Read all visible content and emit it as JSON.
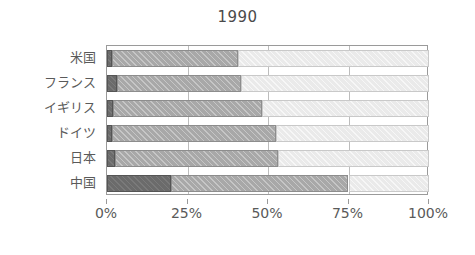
{
  "chart_data": {
    "type": "bar",
    "orientation": "horizontal",
    "stacked": true,
    "normalized": true,
    "title": "1990",
    "xlabel": "",
    "ylabel": "",
    "xlim": [
      0,
      100
    ],
    "grid": true,
    "legend": null,
    "categories": [
      "米国",
      "フランス",
      "イギリス",
      "ドイツ",
      "日本",
      "中国"
    ],
    "xticks": [
      0,
      25,
      50,
      75,
      100
    ],
    "xtick_labels": [
      "0%",
      "25%",
      "50%",
      "75%",
      "100%"
    ],
    "series": [
      {
        "name": "segment-1",
        "color": "#6b6b6b",
        "values": [
          1.5,
          3.0,
          2.0,
          1.5,
          2.5,
          20.0
        ]
      },
      {
        "name": "segment-2",
        "color": "#a8a8a8",
        "values": [
          39.2,
          38.6,
          46.0,
          51.0,
          50.5,
          55.0
        ]
      },
      {
        "name": "segment-3",
        "color": "#eaeaea",
        "values": [
          59.3,
          58.4,
          52.0,
          47.5,
          47.0,
          25.0
        ]
      }
    ],
    "rows": [
      {
        "category": "米国",
        "segments": [
          1.5,
          39.2,
          59.3
        ],
        "cumulative": [
          1.5,
          40.7,
          100.0
        ]
      },
      {
        "category": "フランス",
        "segments": [
          3.0,
          38.6,
          58.4
        ],
        "cumulative": [
          3.0,
          41.6,
          100.0
        ]
      },
      {
        "category": "イギリス",
        "segments": [
          2.0,
          46.0,
          52.0
        ],
        "cumulative": [
          2.0,
          48.0,
          100.0
        ]
      },
      {
        "category": "ドイツ",
        "segments": [
          1.5,
          51.0,
          47.5
        ],
        "cumulative": [
          1.5,
          52.5,
          100.0
        ]
      },
      {
        "category": "日本",
        "segments": [
          2.5,
          50.5,
          47.0
        ],
        "cumulative": [
          2.5,
          53.0,
          100.0
        ]
      },
      {
        "category": "中国",
        "segments": [
          20.0,
          55.0,
          25.0
        ],
        "cumulative": [
          20.0,
          75.0,
          100.0
        ]
      }
    ]
  },
  "colors": {
    "axis": "#9a9a9a",
    "grid": "#bdbdbd",
    "text": "#5a5a5a",
    "background": "#ffffff",
    "segment_dark": "#6b6b6b",
    "segment_mid": "#a8a8a8",
    "segment_light": "#eaeaea"
  }
}
